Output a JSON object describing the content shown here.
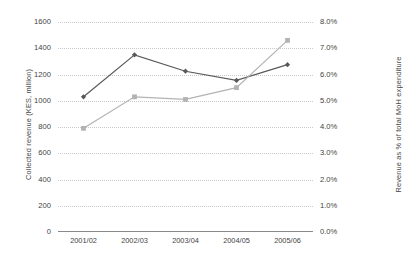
{
  "chart_data": {
    "type": "line",
    "title": "",
    "xlabel": "",
    "categories": [
      "2001/02",
      "2002/03",
      "2003/04",
      "2004/05",
      "2005/06"
    ],
    "grid": true,
    "legend": "none",
    "axes": {
      "left": {
        "label": "Collected revenue (KES, million)",
        "ylim": [
          0,
          1600
        ],
        "tick_step": 200,
        "ticks": [
          "0",
          "200",
          "400",
          "600",
          "800",
          "1000",
          "1200",
          "1400",
          "1600"
        ]
      },
      "right": {
        "label": "Revenue as % of total MoH expenditure",
        "ylim": [
          0,
          8
        ],
        "tick_step": 1,
        "ticks": [
          "0.0%",
          "1.0%",
          "2.0%",
          "3.0%",
          "4.0%",
          "5.0%",
          "6.0%",
          "7.0%",
          "8.0%"
        ]
      }
    },
    "series": [
      {
        "name": "Collected revenue (KES, million)",
        "axis": "left",
        "color": "#595959",
        "marker": "diamond",
        "values": [
          1030,
          1350,
          1225,
          1155,
          1275
        ]
      },
      {
        "name": "Revenue as % of total MoH expenditure",
        "axis": "right",
        "color": "#b3b3b3",
        "marker": "square",
        "values": [
          3.95,
          5.15,
          5.05,
          5.5,
          7.3
        ]
      }
    ]
  }
}
